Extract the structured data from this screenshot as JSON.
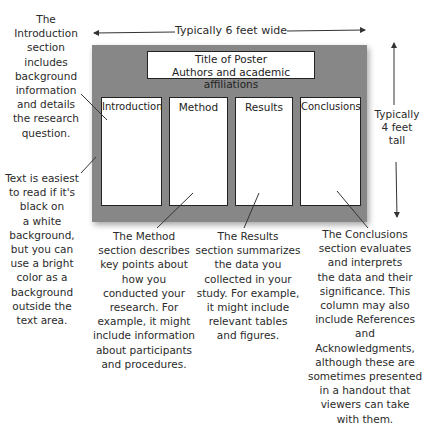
{
  "dimensions": {
    "width_label": "Typically 6 feet wide",
    "height_label": "Typically\n4 feet\ntall"
  },
  "poster": {
    "background_color": "#878787",
    "title_line1": "Title of Poster",
    "title_line2": "Authors and academic affiliations",
    "columns": [
      {
        "label": "Introduction"
      },
      {
        "label": "Method"
      },
      {
        "label": "Results"
      },
      {
        "label": "Conclusions"
      }
    ]
  },
  "annotations": {
    "introduction": "The\nIntroduction\nsection\nincludes\nbackground\ninformation\nand details\nthe research\nquestion.",
    "background": "Text is easiest\nto read if it's\nblack on\na white\nbackground,\nbut you can\nuse a bright\ncolor as a\nbackground\noutside the\ntext area.",
    "method": "The Method\nsection describes\nkey points about\nhow you\nconducted your\nresearch. For\nexample, it might\ninclude information\nabout participants\nand procedures.",
    "results": "The Results\nsection summarizes\nthe data you\ncollected in your\nstudy. For example,\nit might include\nrelevant tables\nand figures.",
    "conclusions": "The Conclusions\nsection evaluates\nand interprets\nthe data and their\nsignificance. This\ncolumn may also\ninclude References\nand Acknowledgments,\nalthough these are\nsometimes presented\nin a handout that\nviewers can take\nwith them."
  }
}
